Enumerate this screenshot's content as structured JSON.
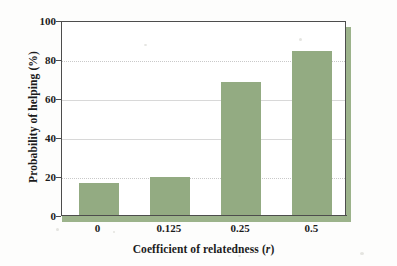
{
  "chart_data": {
    "type": "bar",
    "title": "",
    "xlabel": "Coefficient of relatedness (r)",
    "xlabel_plain": "Coefficient of relatedness",
    "xlabel_italic_symbol": "r",
    "ylabel": "Probability of helping (%)",
    "categories": [
      "0",
      "0.125",
      "0.25",
      "0.5"
    ],
    "values": [
      17,
      20,
      69,
      84.5
    ],
    "ylim": [
      0,
      100
    ],
    "yticks": [
      0,
      20,
      40,
      60,
      80,
      100
    ],
    "ytick_labels": [
      "0",
      "20",
      "40",
      "60",
      "80",
      "100"
    ],
    "grid": true,
    "grid_axis": "y",
    "legend": null,
    "bar_color": "#93ab82",
    "axis_color": "#4d4d4d",
    "grid_color": "#d8d8d8",
    "shadow_color": "#9cb38b",
    "background_color": "#ffffff"
  },
  "axes": {
    "y_title": "Probability of helping (%)",
    "x_title_prefix": "Coefficient of relatedness (",
    "x_title_symbol": "r",
    "x_title_suffix": ")"
  }
}
